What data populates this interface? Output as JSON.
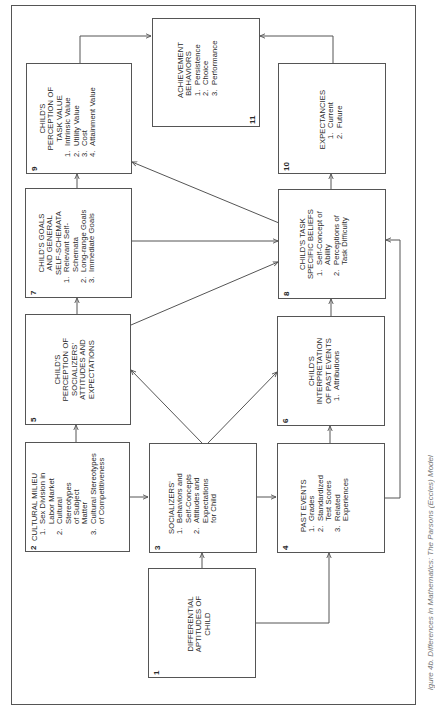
{
  "diagram": {
    "caption": "igure 4b. Differences in Mathematics: The Parsons (Eccles) Model",
    "boxes": {
      "b1": {
        "number": "1",
        "title": "DIFFERENTIAL APTITUDES OF CHILD",
        "items": []
      },
      "b2": {
        "number": "2",
        "title": "CULTURAL MILIEU",
        "items": [
          {
            "n": "1.",
            "text": "Sex Division in Labor Market"
          },
          {
            "n": "2.",
            "text": "Cultural Stereotypes of Subject Matter"
          },
          {
            "n": "3.",
            "text": "Cultural Stereotypes of Competitiveness"
          }
        ]
      },
      "b3": {
        "number": "3",
        "title": "SOCIALIZERS'",
        "items": [
          {
            "n": "1.",
            "text": "Behaviors and Self-Concepts"
          },
          {
            "n": "2.",
            "text": "Attitudes and Expectations for Child"
          }
        ]
      },
      "b4": {
        "number": "4",
        "title": "PAST EVENTS",
        "items": [
          {
            "n": "1.",
            "text": "Grades"
          },
          {
            "n": "2.",
            "text": "Standardized Test Scores"
          },
          {
            "n": "3.",
            "text": "Related Experiences"
          }
        ]
      },
      "b5": {
        "number": "5",
        "title": "CHILD'S PERCEPTION OF SOCIALIZERS' ATTITUDES AND EXPECTATIONS",
        "items": []
      },
      "b6": {
        "number": "6",
        "title": "CHILD'S INTERPRETATION OF PAST EVENTS",
        "items": [
          {
            "n": "1.",
            "text": "Attributions"
          }
        ]
      },
      "b7": {
        "number": "7",
        "title": "CHILD'S GOALS AND GENERAL SELF-SCHEMATA",
        "items": [
          {
            "n": "1.",
            "text": "Relevant Self-Schemata"
          },
          {
            "n": "2.",
            "text": "Long-range Goals"
          },
          {
            "n": "3.",
            "text": "Immediate Goals"
          }
        ]
      },
      "b8": {
        "number": "8",
        "title": "CHILD'S TASK SPECIFIC BELIEFS",
        "items": [
          {
            "n": "1.",
            "text": "Self-Concept of Ability"
          },
          {
            "n": "2.",
            "text": "Perceptions of Task Difficulty"
          }
        ]
      },
      "b9": {
        "number": "9",
        "title": "CHILD'S PERCEPTION OF TASK VALUE",
        "items": [
          {
            "n": "1.",
            "text": "Intrinsic Value"
          },
          {
            "n": "2.",
            "text": "Utility Value"
          },
          {
            "n": "3.",
            "text": "Cost"
          },
          {
            "n": "4.",
            "text": "Attainment Value"
          }
        ]
      },
      "b10": {
        "number": "10",
        "title": "EXPECTANCIES",
        "items": [
          {
            "n": "1.",
            "text": "Current"
          },
          {
            "n": "2.",
            "text": "Future"
          }
        ]
      },
      "b11": {
        "number": "11",
        "title": "ACHIEVEMENT BEHAVIORS",
        "items": [
          {
            "n": "1.",
            "text": "Persistence"
          },
          {
            "n": "2.",
            "text": "Choice"
          },
          {
            "n": "3.",
            "text": "Performance"
          }
        ]
      }
    },
    "edges": [
      {
        "from": "1",
        "to": "3"
      },
      {
        "from": "1",
        "to": "4"
      },
      {
        "from": "2",
        "to": "3"
      },
      {
        "from": "2",
        "to": "5"
      },
      {
        "from": "3",
        "to": "4",
        "bidirectional": true
      },
      {
        "from": "3",
        "to": "5"
      },
      {
        "from": "3",
        "to": "6"
      },
      {
        "from": "4",
        "to": "6"
      },
      {
        "from": "4",
        "to": "8"
      },
      {
        "from": "5",
        "to": "7"
      },
      {
        "from": "5",
        "to": "8"
      },
      {
        "from": "6",
        "to": "8"
      },
      {
        "from": "7",
        "to": "8",
        "bidirectional": true
      },
      {
        "from": "7",
        "to": "9"
      },
      {
        "from": "8",
        "to": "9"
      },
      {
        "from": "8",
        "to": "10"
      },
      {
        "from": "9",
        "to": "11"
      },
      {
        "from": "10",
        "to": "11"
      }
    ]
  }
}
